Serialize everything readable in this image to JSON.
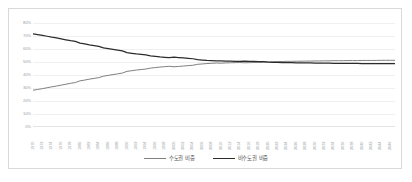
{
  "chart_data": {
    "type": "line",
    "title": "",
    "xlabel": "",
    "ylabel": "",
    "ylim": [
      0,
      80
    ],
    "yunit": "%",
    "grid": true,
    "legend_position": "bottom-center",
    "ytick_labels": [
      "80%",
      "70%",
      "60%",
      "50%",
      "40%",
      "30%",
      "20%",
      "10%",
      "0%"
    ],
    "ytick_values": [
      80,
      70,
      60,
      50,
      40,
      30,
      20,
      10,
      0
    ],
    "categories": [
      "1970",
      "1971",
      "1972",
      "1973",
      "1974",
      "1975",
      "1976",
      "1977",
      "1978",
      "1979",
      "1980",
      "1981",
      "1982",
      "1983",
      "1984",
      "1985",
      "1986",
      "1987",
      "1988",
      "1989",
      "1990",
      "1991",
      "1992",
      "1993",
      "1994",
      "1995",
      "1996",
      "1997",
      "1998",
      "1999",
      "2000",
      "2001",
      "2002",
      "2003",
      "2004",
      "2005",
      "2006",
      "2007",
      "2008",
      "2009",
      "2010",
      "2011",
      "2012",
      "2013",
      "2014",
      "2015",
      "2016",
      "2017",
      "2018",
      "2019",
      "2020",
      "2021",
      "2022",
      "2023",
      "2024",
      "2025",
      "2026",
      "2027",
      "2028",
      "2029",
      "2030",
      "2031",
      "2032",
      "2033",
      "2034",
      "2035",
      "2036",
      "2037",
      "2038",
      "2039",
      "2040",
      "2041",
      "2042",
      "2043",
      "2044",
      "2045",
      "2046",
      "2047"
    ],
    "xtick_labels": [
      "1970",
      "1972",
      "1974",
      "1976",
      "1978",
      "1980",
      "1982",
      "1984",
      "1986",
      "1988",
      "1990",
      "1992",
      "1994",
      "1996",
      "1998",
      "2000",
      "2002",
      "2004",
      "2006",
      "2008",
      "2010",
      "2012",
      "2014",
      "2016",
      "2018",
      "2020",
      "2022",
      "2024",
      "2026",
      "2028",
      "2030",
      "2032",
      "2034",
      "2036",
      "2038",
      "2040",
      "2042",
      "2044",
      "2046"
    ],
    "series": [
      {
        "name": "수도권 비중",
        "color": "#808080",
        "values": [
          28.3,
          28.9,
          29.5,
          30.2,
          30.9,
          31.5,
          32.2,
          32.9,
          33.6,
          34.2,
          35.5,
          36.1,
          36.8,
          37.4,
          38.0,
          39.1,
          39.7,
          40.3,
          40.9,
          41.5,
          42.8,
          43.3,
          43.8,
          44.2,
          44.6,
          45.3,
          45.7,
          46.1,
          46.4,
          46.7,
          46.3,
          46.6,
          46.9,
          47.2,
          47.5,
          48.2,
          48.5,
          48.8,
          49.0,
          49.2,
          49.1,
          49.3,
          49.4,
          49.5,
          49.6,
          49.4,
          49.5,
          49.6,
          49.7,
          49.8,
          50.1,
          50.2,
          50.3,
          50.4,
          50.5,
          50.5,
          50.6,
          50.6,
          50.7,
          50.7,
          50.8,
          50.8,
          50.9,
          50.9,
          51.0,
          51.0,
          51.0,
          51.1,
          51.1,
          51.1,
          51.2,
          51.2,
          51.2,
          51.2,
          51.3,
          51.3,
          51.3,
          51.3
        ]
      },
      {
        "name": "비수도권 비중",
        "color": "#2b2b2b",
        "values": [
          71.7,
          71.1,
          70.5,
          69.8,
          69.1,
          68.5,
          67.8,
          67.1,
          66.4,
          65.8,
          64.5,
          63.9,
          63.2,
          62.6,
          62.0,
          60.9,
          60.3,
          59.7,
          59.1,
          58.5,
          57.2,
          56.7,
          56.2,
          55.8,
          55.4,
          54.7,
          54.3,
          53.9,
          53.6,
          53.3,
          53.7,
          53.4,
          53.1,
          52.8,
          52.5,
          51.8,
          51.5,
          51.2,
          51.0,
          50.8,
          50.9,
          50.7,
          50.6,
          50.5,
          50.4,
          50.6,
          50.5,
          50.4,
          50.3,
          50.2,
          49.9,
          49.8,
          49.7,
          49.6,
          49.5,
          49.5,
          49.4,
          49.4,
          49.3,
          49.3,
          49.2,
          49.2,
          49.1,
          49.1,
          49.0,
          49.0,
          49.0,
          48.9,
          48.9,
          48.9,
          48.8,
          48.8,
          48.8,
          48.8,
          48.7,
          48.7,
          48.7,
          48.7
        ]
      }
    ]
  },
  "legend": {
    "items": [
      {
        "label": "수도권 비중",
        "color": "#808080"
      },
      {
        "label": "비수도권 비중",
        "color": "#2b2b2b"
      }
    ]
  }
}
